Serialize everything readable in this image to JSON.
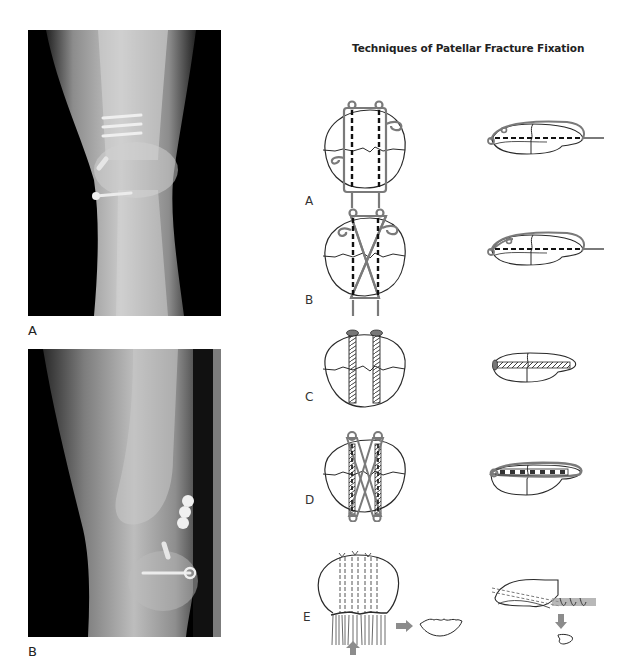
{
  "figure": {
    "title": "Techniques of Patellar Fracture Fixation"
  },
  "radiographs": [
    {
      "label": "A",
      "view": "anteroposterior knee radiograph"
    },
    {
      "label": "B",
      "view": "lateral knee radiograph"
    }
  ],
  "techniques": [
    {
      "label": "A",
      "name": "anterior tension band with longitudinal K-wires"
    },
    {
      "label": "B",
      "name": "figure-of-eight tension band with K-wires"
    },
    {
      "label": "C",
      "name": "interfragmentary lag screws"
    },
    {
      "label": "D",
      "name": "cannulated screws with tension band"
    },
    {
      "label": "E",
      "name": "partial patellectomy with tendon reattachment"
    }
  ],
  "colors": {
    "background": "#ffffff",
    "line": "#2a2a2a",
    "wire": "#7a7a7a",
    "arrow": "#8c8c8c",
    "xray_bg": "#000000"
  }
}
